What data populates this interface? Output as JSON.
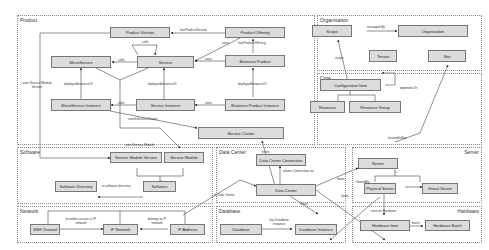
{
  "packages": {
    "product": "Product",
    "organisation": "Organisation",
    "core": "Core",
    "software": "Software",
    "data_center": "Data Center",
    "server": "Server",
    "network": "Network",
    "database": "Database",
    "hardware": "Hardware"
  },
  "nodes": {
    "product_version": "Product Version",
    "product_offering": "Product Offering",
    "microservice": "MicroService",
    "service": "Service",
    "business_product": "Business Product",
    "microservice_instance": "MicroService Instance",
    "service_instance": "Service Instance",
    "business_product_instance": "Business Product Instance",
    "service_cluster": "Service Cluster",
    "scope": "Scope",
    "organisation": "Organisation",
    "tenant": "Tenant",
    "site": "Site",
    "configuration_item": "Configuration Item",
    "resource": "Resource",
    "resource_group": "Resource Group",
    "service_module_version": "Service Module Version",
    "service_module": "Service Module",
    "software_directory": "Software Directory",
    "software": "Software",
    "data_center_connection": "Data Center Connection",
    "data_center": "Data Center",
    "server": "Server",
    "physical_server": "Physical Server",
    "virtual_server": "Virtual Server",
    "ssh_channel": "SSH Channel",
    "ip_network": "IP Network",
    "ip_address": "IP Address",
    "database": "Database",
    "database_instance": "Database Instance",
    "hardware_item": "Hardware Item",
    "hardware_batch": "Hardware Batch"
  },
  "edge_labels": {
    "has_product_version": "hasProductVersion",
    "uses_product_offering": "uses",
    "has_product_offering": "hasProductOffering",
    "calls_self": "calls",
    "calls_micro": "calls",
    "uses_business": "uses",
    "deployed_instance_of_micro": "deployedInstanceOf",
    "deployed_instance_of_service": "deployedInstanceOf",
    "deployed_instance_of_business": "deployedInstanceOf",
    "calls_instance": "calls",
    "uses_instance": "uses",
    "runs_in_service_cluster": "runsInServiceCluster",
    "uses_service_module_version": "uses Service Module Version",
    "uses_service_module": "uses Service Module",
    "managed_by": "managed By",
    "scope": "scope",
    "depends_on": "depends On",
    "located_in_site": "locatedInSite",
    "in_software_directory": "in software directory",
    "hosts_cluster": "hosts",
    "allows_connection_via": "allows Connection via",
    "in_data_center": "in Data Center",
    "hosts_server": "hosts",
    "hosts_hw": "hosts",
    "hosts_db": "hosts",
    "hosted_by": "hostedBy",
    "provides_access": "provides access to IP network",
    "belongs_to": "belongs to IP network",
    "has_db_instance": "has Database Instance",
    "runs_on_hardware": "runs on Hardware",
    "batch": "batch"
  }
}
